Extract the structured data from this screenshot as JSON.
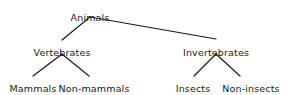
{
  "diagram": {
    "type": "tree",
    "background_color": "#ffffff",
    "line_color": "#1a1a1a",
    "text_color": "#1a1a1a",
    "nodes": [
      {
        "id": "animals",
        "label": "Animals",
        "level": 1,
        "x": 90,
        "y": 12
      },
      {
        "id": "vertebrates",
        "label": "Vertebrates",
        "level": 2,
        "x": 62,
        "y": 47
      },
      {
        "id": "invertebrates",
        "label": "Invertebrates",
        "level": 2,
        "x": 216,
        "y": 47
      },
      {
        "id": "mammals",
        "label": "Mammals",
        "level": 3,
        "x": 33,
        "y": 83
      },
      {
        "id": "non-mammals",
        "label": "Non-mammals",
        "level": 3,
        "x": 94,
        "y": 83
      },
      {
        "id": "insects",
        "label": "Insects",
        "level": 3,
        "x": 193,
        "y": 83
      },
      {
        "id": "non-insects",
        "label": "Non-insects",
        "level": 3,
        "x": 251,
        "y": 83
      }
    ],
    "edges": [
      {
        "from": "animals",
        "to": "vertebrates",
        "x1": 90,
        "y1": 17,
        "x2": 62,
        "y2": 40
      },
      {
        "from": "animals",
        "to": "invertebrates",
        "x1": 90,
        "y1": 17,
        "x2": 216,
        "y2": 39
      },
      {
        "from": "vertebrates",
        "to": "mammals",
        "x1": 62,
        "y1": 54,
        "x2": 33,
        "y2": 76
      },
      {
        "from": "vertebrates",
        "to": "non-mammals",
        "x1": 62,
        "y1": 54,
        "x2": 89,
        "y2": 76
      },
      {
        "from": "invertebrates",
        "to": "insects",
        "x1": 216,
        "y1": 54,
        "x2": 194,
        "y2": 76
      },
      {
        "from": "invertebrates",
        "to": "non-insects",
        "x1": 216,
        "y1": 54,
        "x2": 240,
        "y2": 76
      }
    ]
  }
}
